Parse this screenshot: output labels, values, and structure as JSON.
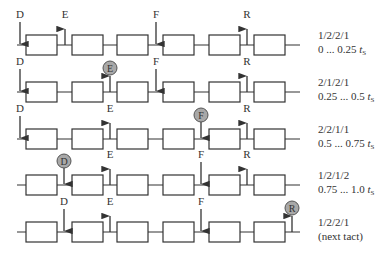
{
  "diagram": {
    "type": "transfer-line timing diagram",
    "colors": {
      "line": "#333333",
      "box_fill": "#ffffff",
      "circle_fill": "#a8a8a8",
      "text": "#333333"
    },
    "rows": [
      {
        "index": 1,
        "line_y": 45,
        "markers": [
          {
            "label": "D",
            "x": 20,
            "dir": "down",
            "active": false
          },
          {
            "label": "E",
            "x": 65,
            "dir": "up",
            "active": false
          },
          {
            "label": "F",
            "x": 156,
            "dir": "down",
            "active": false
          },
          {
            "label": "R",
            "x": 247,
            "dir": "up",
            "active": false
          }
        ],
        "side_label_1": "1/2/2/1",
        "side_label_2": "0 ... 0.25 ",
        "side_label_t": "t",
        "side_label_sub": "S"
      },
      {
        "index": 2,
        "line_y": 92,
        "markers": [
          {
            "label": "D",
            "x": 20,
            "dir": "down",
            "active": false
          },
          {
            "label": "E",
            "x": 110,
            "dir": "up",
            "active": true
          },
          {
            "label": "F",
            "x": 156,
            "dir": "down",
            "active": false
          },
          {
            "label": "R",
            "x": 247,
            "dir": "up",
            "active": false
          }
        ],
        "side_label_1": "2/1/2/1",
        "side_label_2": "0.25 ... 0.5 ",
        "side_label_t": "t",
        "side_label_sub": "S"
      },
      {
        "index": 3,
        "line_y": 139,
        "markers": [
          {
            "label": "D",
            "x": 20,
            "dir": "down",
            "active": false
          },
          {
            "label": "E",
            "x": 110,
            "dir": "up",
            "active": false
          },
          {
            "label": "F",
            "x": 201,
            "dir": "down",
            "active": true
          },
          {
            "label": "R",
            "x": 247,
            "dir": "up",
            "active": false
          }
        ],
        "side_label_1": "2/2/1/1",
        "side_label_2": "0.5 ... 0.75 ",
        "side_label_t": "t",
        "side_label_sub": "S"
      },
      {
        "index": 4,
        "line_y": 185,
        "markers": [
          {
            "label": "D",
            "x": 64,
            "dir": "down",
            "active": true
          },
          {
            "label": "E",
            "x": 110,
            "dir": "up",
            "active": false
          },
          {
            "label": "F",
            "x": 201,
            "dir": "down",
            "active": false
          },
          {
            "label": "R",
            "x": 247,
            "dir": "up",
            "active": false
          }
        ],
        "side_label_1": "1/2/1/2",
        "side_label_2": "0.75 ... 1.0 ",
        "side_label_t": "t",
        "side_label_sub": "S"
      },
      {
        "index": 5,
        "line_y": 232,
        "markers": [
          {
            "label": "D",
            "x": 64,
            "dir": "down",
            "active": false
          },
          {
            "label": "E",
            "x": 110,
            "dir": "up",
            "active": false
          },
          {
            "label": "F",
            "x": 201,
            "dir": "down",
            "active": false
          },
          {
            "label": "R",
            "x": 292,
            "dir": "up",
            "active": true
          }
        ],
        "side_label_1": "1/2/2/1",
        "side_label_2": "(next tact)",
        "side_label_t": "",
        "side_label_sub": ""
      }
    ],
    "boxes_x": [
      26,
      72,
      117,
      163,
      209,
      254
    ],
    "box_width": 31,
    "box_height": 20,
    "line_start_x": 17,
    "line_end_x": 300
  }
}
